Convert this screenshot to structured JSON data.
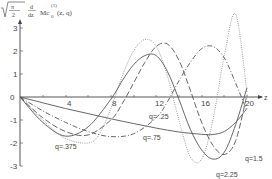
{
  "chart_data": {
    "type": "line",
    "title": "",
    "ylabel": "√(π/2) d/dz Mc₀⁽¹⁾(z,q)",
    "xlabel": "z",
    "xlim": [
      0,
      21
    ],
    "ylim": [
      -3,
      3.5
    ],
    "x_ticks": [
      4,
      8,
      12,
      16,
      20
    ],
    "y_ticks": [
      3,
      2,
      1,
      0,
      -1,
      -2,
      -3
    ],
    "grid": false,
    "series": [
      {
        "name": "q=.25",
        "style": "solid",
        "x": [
          0,
          2,
          4,
          6,
          8,
          10,
          12,
          14,
          16,
          17,
          18,
          19,
          20
        ],
        "y": [
          0,
          -0.25,
          -0.5,
          -0.72,
          -0.95,
          -1.15,
          -1.35,
          -1.52,
          -1.62,
          -1.63,
          -1.5,
          -1.1,
          -0.5
        ]
      },
      {
        "name": "q=.375",
        "style": "dotted",
        "x": [
          0,
          2,
          4,
          6,
          7,
          8,
          9,
          10,
          11,
          12,
          13,
          14,
          15,
          16,
          17,
          18,
          19,
          20
        ],
        "y": [
          0,
          -1.0,
          -1.8,
          -2.0,
          -1.6,
          -0.5,
          0.9,
          2.0,
          2.5,
          2.2,
          0.9,
          -1.0,
          -2.6,
          -2.7,
          -1.0,
          1.8,
          3.6,
          0.2
        ]
      },
      {
        "name": "q=.75",
        "style": "dash-dot",
        "x": [
          0,
          2,
          4,
          6,
          8,
          10,
          12,
          13,
          14,
          15,
          16,
          17,
          18,
          19,
          20
        ],
        "y": [
          0,
          -0.6,
          -1.1,
          -1.5,
          -1.72,
          -1.6,
          -0.9,
          -0.2,
          0.7,
          1.5,
          2.1,
          2.2,
          1.7,
          0.6,
          -0.6
        ]
      },
      {
        "name": "q=1.5",
        "style": "long-dash",
        "x": [
          0,
          2,
          4,
          6,
          8,
          9,
          10,
          11,
          12,
          13,
          14,
          15,
          16,
          17,
          18,
          19,
          20
        ],
        "y": [
          0,
          -0.9,
          -1.5,
          -1.65,
          -1.0,
          -0.3,
          0.6,
          1.5,
          2.2,
          2.3,
          1.6,
          0.3,
          -1.1,
          -2.1,
          -2.5,
          -1.9,
          0.1
        ]
      },
      {
        "name": "q=2.25",
        "style": "solid",
        "x": [
          0,
          2,
          4,
          6,
          8,
          9,
          10,
          11,
          12,
          13,
          14,
          15,
          16,
          17,
          18,
          19,
          20
        ],
        "y": [
          0,
          -1.1,
          -1.7,
          -1.3,
          -0.1,
          0.7,
          1.4,
          1.8,
          1.8,
          1.1,
          -0.1,
          -1.4,
          -2.3,
          -2.7,
          -2.4,
          -1.2,
          0.4
        ]
      }
    ],
    "annotations": [
      "q=.25",
      "q=.375",
      "q=.75",
      "q=1.5",
      "q=2.25"
    ]
  },
  "axes": {
    "ylabel_parts": {
      "sqrt": "π",
      "sqrt_den": "2",
      "deriv_num": "d",
      "deriv_den": "dz",
      "func": "Mc",
      "sub": "0",
      "sup": "(1)",
      "args": "(z, q)"
    },
    "xlabel": "z",
    "x_ticks": [
      "4",
      "8",
      "12",
      "16",
      "20"
    ],
    "y_ticks": [
      "3",
      "2",
      "1",
      "0",
      "-1",
      "-2",
      "-3"
    ]
  },
  "labels": {
    "q025": "q= .25",
    "q0375": "q=.375",
    "q075": "q=.75",
    "q15": "q=1.5",
    "q225": "q=2.25"
  }
}
